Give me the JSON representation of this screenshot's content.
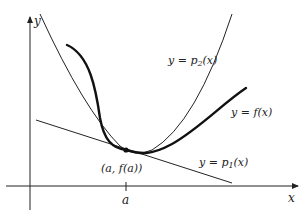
{
  "figure": {
    "axes": {
      "x_label": "x",
      "y_label": "y",
      "tick_label": "a"
    },
    "point_label": "(a, f(a))",
    "curves": [
      {
        "id": "p2",
        "label_prefix": "y = p",
        "label_sub": "2",
        "label_suffix": "(x)",
        "style": "thin"
      },
      {
        "id": "f",
        "label": "y = f(x)",
        "style": "thick"
      },
      {
        "id": "p1",
        "label_prefix": "y = p",
        "label_sub": "1",
        "label_suffix": "(x)",
        "style": "thin"
      }
    ],
    "colors": {
      "ink": "#222222",
      "background": "#ffffff"
    }
  }
}
